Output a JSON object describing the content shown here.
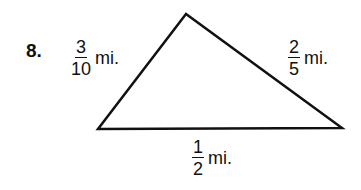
{
  "problem": {
    "number": "8.",
    "figure": "triangle",
    "sides": [
      {
        "id": "left",
        "numerator": "3",
        "denominator": "10",
        "unit": "mi."
      },
      {
        "id": "right",
        "numerator": "2",
        "denominator": "5",
        "unit": "mi."
      },
      {
        "id": "bottom",
        "numerator": "1",
        "denominator": "2",
        "unit": "mi."
      }
    ],
    "vertices": {
      "top": [
        186,
        14
      ],
      "bottom_left": [
        98,
        129
      ],
      "bottom_right": [
        342,
        128
      ]
    },
    "stroke_color": "#111111"
  }
}
